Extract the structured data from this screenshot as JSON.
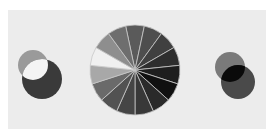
{
  "caption": {
    "text": "",
    "note": "cropped text line at top edge, illegible"
  },
  "figure": {
    "background": "#ececec",
    "left_venn": {
      "circle_a": {
        "cx": 33,
        "cy": 65,
        "r": 15,
        "fill": "#9a9a9a"
      },
      "circle_b": {
        "cx": 42,
        "cy": 79,
        "r": 20,
        "fill": "#3a3a3a"
      },
      "overlap_fill": "#f4f4f4"
    },
    "pie": {
      "cx": 135,
      "cy": 70,
      "r": 45,
      "separator": "#c8c8c8",
      "wedges": [
        {
          "fill": "#5a5a5a"
        },
        {
          "fill": "#4e4e4e"
        },
        {
          "fill": "#404040"
        },
        {
          "fill": "#2e2e2e"
        },
        {
          "fill": "#1e1e1e"
        },
        {
          "fill": "#101010"
        },
        {
          "fill": "#2a2a2a"
        },
        {
          "fill": "#383838"
        },
        {
          "fill": "#454545"
        },
        {
          "fill": "#525252"
        },
        {
          "fill": "#6a6a6a"
        },
        {
          "fill": "#a8a8a8"
        },
        {
          "fill": "#f0f0f0"
        },
        {
          "fill": "#8e8e8e"
        },
        {
          "fill": "#6e6e6e"
        }
      ]
    },
    "right_venn": {
      "circle_a": {
        "cx": 230,
        "cy": 67,
        "r": 15,
        "fill": "#7a7a7a"
      },
      "circle_b": {
        "cx": 238,
        "cy": 82,
        "r": 17,
        "fill": "#4a4a4a"
      },
      "overlap_fill": "#0a0a0a"
    }
  }
}
